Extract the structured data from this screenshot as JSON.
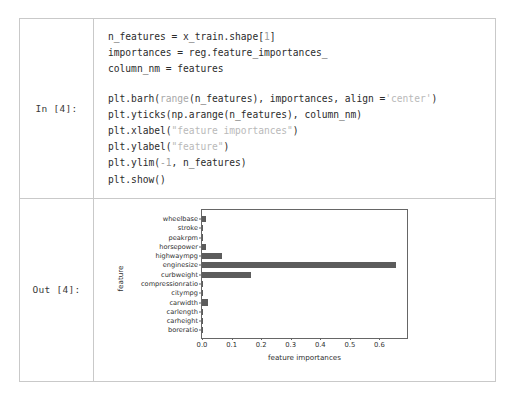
{
  "top_strip": {
    "ghost_text": "·· ··  ·  ·· ··  ···  ··   · · ··"
  },
  "notebook": {
    "input": {
      "prompt": "In [4]:",
      "code_lines": [
        [
          {
            "t": "n_features = x_train.shape[",
            "c": "plain"
          },
          {
            "t": "1",
            "c": "num"
          },
          {
            "t": "]",
            "c": "plain"
          }
        ],
        [
          {
            "t": "importances = reg.feature_importances_",
            "c": "plain"
          }
        ],
        [
          {
            "t": "column_nm = features",
            "c": "plain"
          }
        ],
        [],
        [
          {
            "t": "plt.barh(",
            "c": "plain"
          },
          {
            "t": "range",
            "c": "fn"
          },
          {
            "t": "(n_features), importances, align =",
            "c": "plain"
          },
          {
            "t": "'center'",
            "c": "str"
          },
          {
            "t": ")",
            "c": "plain"
          }
        ],
        [
          {
            "t": "plt.yticks(np.arange(n_features), column_nm)",
            "c": "plain"
          }
        ],
        [
          {
            "t": "plt.xlabel(",
            "c": "plain"
          },
          {
            "t": "\"feature importances\"",
            "c": "str"
          },
          {
            "t": ")",
            "c": "plain"
          }
        ],
        [
          {
            "t": "plt.ylabel(",
            "c": "plain"
          },
          {
            "t": "\"feature\"",
            "c": "str"
          },
          {
            "t": ")",
            "c": "plain"
          }
        ],
        [
          {
            "t": "plt.ylim(",
            "c": "plain"
          },
          {
            "t": "-1",
            "c": "num"
          },
          {
            "t": ", n_features)",
            "c": "plain"
          }
        ],
        [
          {
            "t": "plt.show()",
            "c": "plain"
          }
        ]
      ]
    },
    "output": {
      "prompt": "Out [4]:"
    }
  },
  "colors": {
    "bar": "#5c5c5c",
    "axis": "#666666",
    "cell_border": "#c9c9c9",
    "text": "#2b2b2b",
    "string_token": "#b9b9b9",
    "number_token": "#a0a0a0"
  },
  "chart_data": {
    "type": "bar",
    "orientation": "horizontal",
    "title": "",
    "xlabel": "feature importances",
    "ylabel": "feature",
    "xlim": [
      0.0,
      0.7
    ],
    "ylim": [
      -1,
      13
    ],
    "grid": false,
    "legend": null,
    "xticks": [
      0.0,
      0.1,
      0.2,
      0.3,
      0.4,
      0.5,
      0.6
    ],
    "xticklabels": [
      "0.0",
      "0.1",
      "0.2",
      "0.3",
      "0.4",
      "0.5",
      "0.6"
    ],
    "categories": [
      "boreratio",
      "carheight",
      "carlength",
      "carwidth",
      "citympg",
      "compressionratio",
      "curbweight",
      "enginesize",
      "highwaympg",
      "horsepower",
      "peakrpm",
      "stroke",
      "wheelbase"
    ],
    "values": [
      0.001,
      0.001,
      0.004,
      0.02,
      0.003,
      0.001,
      0.165,
      0.655,
      0.068,
      0.012,
      0.002,
      0.001,
      0.013
    ]
  }
}
